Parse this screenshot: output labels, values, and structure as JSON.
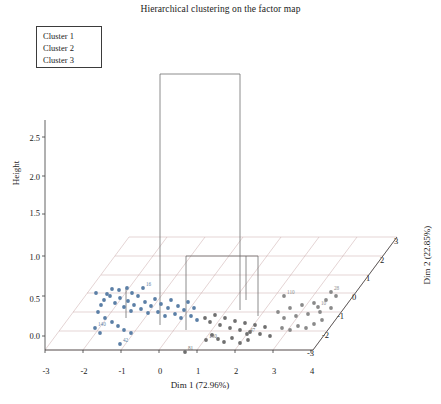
{
  "chart_data": {
    "type": "scatter",
    "title": "Hierarchical clustering on the factor map",
    "xlabel": "Dim 1 (72.96%)",
    "ylabel": "Height",
    "zlabel": "Dim 2 (22.85%)",
    "xticks": [
      "-3",
      "-2",
      "-1",
      "0",
      "1",
      "2",
      "3",
      "4"
    ],
    "yticks": [
      "0.0",
      "0.5",
      "1.0",
      "1.5",
      "2.0",
      "2.5"
    ],
    "zticks": [
      "-3",
      "-2",
      "-1",
      "0",
      "1",
      "2",
      "3"
    ],
    "xlim": [
      -3,
      4
    ],
    "ylim": [
      0,
      2.5
    ],
    "zlim": [
      -3,
      3
    ],
    "grid": true,
    "legend_position": "top-left",
    "legend": [
      {
        "label": "Cluster 1",
        "color": "#5b7fa6"
      },
      {
        "label": "Cluster 2",
        "color": "#6f6f6f"
      },
      {
        "label": "Cluster 3",
        "color": "#8a8a8a"
      }
    ],
    "cluster1_points": [
      {
        "x": 96,
        "y": 293,
        "label": ""
      },
      {
        "x": 104,
        "y": 300,
        "label": ""
      },
      {
        "x": 110,
        "y": 296,
        "label": ""
      },
      {
        "x": 115,
        "y": 303,
        "label": ""
      },
      {
        "x": 120,
        "y": 298,
        "label": ""
      },
      {
        "x": 124,
        "y": 307,
        "label": ""
      },
      {
        "x": 128,
        "y": 301,
        "label": ""
      },
      {
        "x": 131,
        "y": 311,
        "label": ""
      },
      {
        "x": 134,
        "y": 305,
        "label": ""
      },
      {
        "x": 138,
        "y": 296,
        "label": ""
      },
      {
        "x": 141,
        "y": 309,
        "label": ""
      },
      {
        "x": 145,
        "y": 302,
        "label": ""
      },
      {
        "x": 148,
        "y": 313,
        "label": ""
      },
      {
        "x": 151,
        "y": 306,
        "label": ""
      },
      {
        "x": 155,
        "y": 299,
        "label": ""
      },
      {
        "x": 158,
        "y": 312,
        "label": ""
      },
      {
        "x": 161,
        "y": 304,
        "label": ""
      },
      {
        "x": 165,
        "y": 316,
        "label": ""
      },
      {
        "x": 168,
        "y": 308,
        "label": ""
      },
      {
        "x": 171,
        "y": 300,
        "label": ""
      },
      {
        "x": 175,
        "y": 314,
        "label": ""
      },
      {
        "x": 178,
        "y": 306,
        "label": ""
      },
      {
        "x": 181,
        "y": 318,
        "label": ""
      },
      {
        "x": 184,
        "y": 310,
        "label": ""
      },
      {
        "x": 188,
        "y": 302,
        "label": ""
      },
      {
        "x": 191,
        "y": 316,
        "label": ""
      },
      {
        "x": 194,
        "y": 308,
        "label": ""
      },
      {
        "x": 197,
        "y": 320,
        "label": ""
      },
      {
        "x": 143,
        "y": 288,
        "label": "16"
      },
      {
        "x": 132,
        "y": 293,
        "label": ""
      },
      {
        "x": 127,
        "y": 288,
        "label": ""
      },
      {
        "x": 119,
        "y": 290,
        "label": ""
      },
      {
        "x": 112,
        "y": 289,
        "label": ""
      },
      {
        "x": 107,
        "y": 294,
        "label": ""
      },
      {
        "x": 101,
        "y": 305,
        "label": ""
      },
      {
        "x": 98,
        "y": 312,
        "label": ""
      },
      {
        "x": 105,
        "y": 318,
        "label": ""
      },
      {
        "x": 112,
        "y": 322,
        "label": ""
      },
      {
        "x": 118,
        "y": 326,
        "label": ""
      },
      {
        "x": 124,
        "y": 330,
        "label": ""
      },
      {
        "x": 131,
        "y": 333,
        "label": ""
      },
      {
        "x": 95,
        "y": 328,
        "label": "140"
      },
      {
        "x": 100,
        "y": 333,
        "label": ""
      },
      {
        "x": 120,
        "y": 344,
        "label": "42"
      }
    ],
    "cluster2_points": [
      {
        "x": 205,
        "y": 318,
        "label": ""
      },
      {
        "x": 210,
        "y": 322,
        "label": ""
      },
      {
        "x": 215,
        "y": 315,
        "label": ""
      },
      {
        "x": 220,
        "y": 325,
        "label": ""
      },
      {
        "x": 225,
        "y": 318,
        "label": ""
      },
      {
        "x": 230,
        "y": 328,
        "label": ""
      },
      {
        "x": 235,
        "y": 321,
        "label": ""
      },
      {
        "x": 240,
        "y": 330,
        "label": ""
      },
      {
        "x": 245,
        "y": 323,
        "label": ""
      },
      {
        "x": 250,
        "y": 332,
        "label": ""
      },
      {
        "x": 255,
        "y": 325,
        "label": ""
      },
      {
        "x": 260,
        "y": 334,
        "label": ""
      },
      {
        "x": 265,
        "y": 327,
        "label": ""
      },
      {
        "x": 270,
        "y": 336,
        "label": ""
      },
      {
        "x": 212,
        "y": 335,
        "label": ""
      },
      {
        "x": 218,
        "y": 339,
        "label": ""
      },
      {
        "x": 224,
        "y": 342,
        "label": ""
      },
      {
        "x": 232,
        "y": 338,
        "label": ""
      },
      {
        "x": 240,
        "y": 343,
        "label": ""
      },
      {
        "x": 248,
        "y": 340,
        "label": ""
      },
      {
        "x": 185,
        "y": 352,
        "label": "81"
      },
      {
        "x": 206,
        "y": 340,
        "label": "130"
      },
      {
        "x": 247,
        "y": 334,
        "label": "47"
      }
    ],
    "cluster3_points": [
      {
        "x": 278,
        "y": 312,
        "label": ""
      },
      {
        "x": 284,
        "y": 318,
        "label": ""
      },
      {
        "x": 290,
        "y": 308,
        "label": ""
      },
      {
        "x": 296,
        "y": 316,
        "label": ""
      },
      {
        "x": 302,
        "y": 305,
        "label": ""
      },
      {
        "x": 308,
        "y": 314,
        "label": ""
      },
      {
        "x": 314,
        "y": 303,
        "label": ""
      },
      {
        "x": 320,
        "y": 312,
        "label": ""
      },
      {
        "x": 326,
        "y": 300,
        "label": ""
      },
      {
        "x": 331,
        "y": 308,
        "label": ""
      },
      {
        "x": 336,
        "y": 296,
        "label": ""
      },
      {
        "x": 282,
        "y": 328,
        "label": ""
      },
      {
        "x": 290,
        "y": 330,
        "label": ""
      },
      {
        "x": 298,
        "y": 326,
        "label": ""
      },
      {
        "x": 306,
        "y": 328,
        "label": ""
      },
      {
        "x": 314,
        "y": 324,
        "label": ""
      },
      {
        "x": 322,
        "y": 320,
        "label": ""
      },
      {
        "x": 284,
        "y": 296,
        "label": "110"
      },
      {
        "x": 331,
        "y": 292,
        "label": "28"
      },
      {
        "x": 318,
        "y": 307,
        "label": "10"
      }
    ]
  }
}
